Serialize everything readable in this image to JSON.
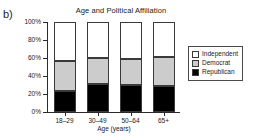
{
  "panel": {
    "label": "b)"
  },
  "chart_data": {
    "type": "bar",
    "subtype": "stacked-100-percent",
    "title": "Age and Political Affiliation",
    "xlabel": "Age (years)",
    "ylabel": "",
    "categories": [
      "18–29",
      "30–49",
      "50–64",
      "65+"
    ],
    "ylim": [
      0,
      100
    ],
    "ytick_labels": [
      "0%",
      "20%",
      "40%",
      "60%",
      "80%",
      "100%"
    ],
    "ytick_values": [
      0,
      20,
      40,
      60,
      80,
      100
    ],
    "grid": false,
    "legend_position": "right",
    "series": [
      {
        "name": "Republican",
        "color": "#000000",
        "values": [
          23,
          31,
          30,
          29
        ]
      },
      {
        "name": "Democrat",
        "color": "#cccccc",
        "values": [
          34,
          29,
          29,
          32
        ]
      },
      {
        "name": "Independent",
        "color": "#ffffff",
        "values": [
          43,
          40,
          41,
          39
        ]
      }
    ]
  },
  "legend": {
    "entries": [
      {
        "label": "Independent",
        "swatch": "white"
      },
      {
        "label": "Democrat",
        "swatch": "gray"
      },
      {
        "label": "Republican",
        "swatch": "black"
      }
    ]
  }
}
